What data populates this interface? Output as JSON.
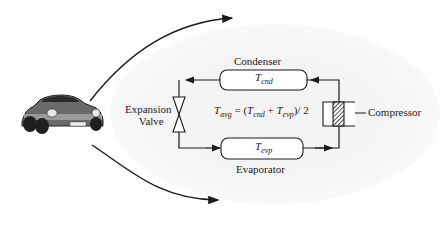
{
  "diagram": {
    "components": {
      "condenser": {
        "label": "Condenser",
        "symbol": "T",
        "subscript": "cnd"
      },
      "evaporator": {
        "label": "Evaporator",
        "symbol": "T",
        "subscript": "evp"
      },
      "expansion_valve": {
        "label_line1": "Expansion",
        "label_line2": "Valve"
      },
      "compressor": {
        "label": "Compressor"
      }
    },
    "equation": {
      "lhs_symbol": "T",
      "lhs_subscript": "avg",
      "equals": " = (",
      "t1": "T",
      "t1_sub": "cnd",
      "plus": " + ",
      "t2": "T",
      "t2_sub": "evp",
      "tail": ")/ 2"
    },
    "car": {
      "description": "sports car"
    },
    "colors": {
      "line": "#1a1a1a",
      "background": "#ffffff",
      "glow": "#f3f3f3"
    }
  }
}
